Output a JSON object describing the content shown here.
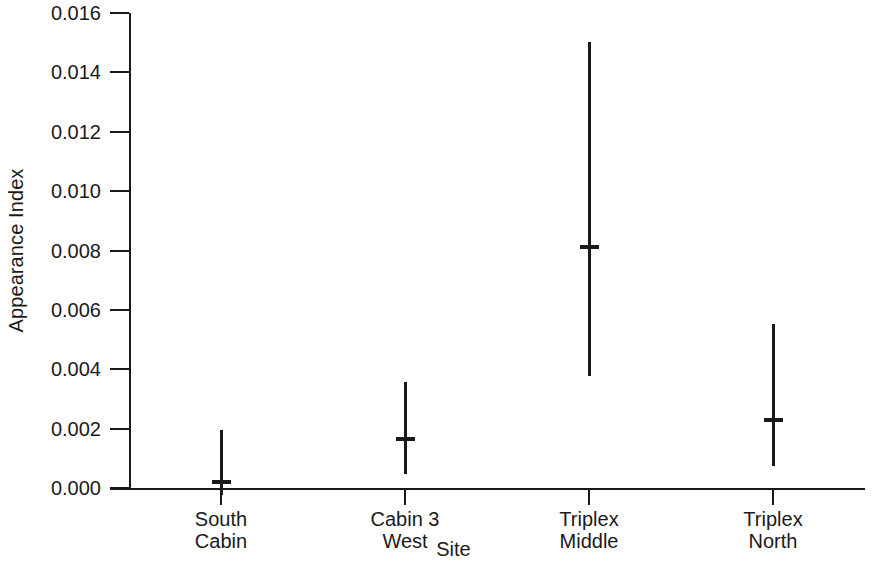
{
  "chart_data": {
    "type": "scatter",
    "title": "",
    "xlabel": "Site",
    "ylabel": "Appearance Index",
    "categories": [
      "South\nCabin",
      "Cabin 3\nWest",
      "Triplex\nMiddle",
      "Triplex\nNorth"
    ],
    "category_lines": [
      [
        "South",
        "Cabin"
      ],
      [
        "Cabin 3",
        "West"
      ],
      [
        "Triplex",
        "Middle"
      ],
      [
        "Triplex",
        "North"
      ]
    ],
    "values": [
      0.0002,
      0.00165,
      0.00812,
      0.00229
    ],
    "error_low": [
      -0.00024,
      0.00047,
      0.00377,
      0.00074
    ],
    "error_high": [
      0.00195,
      0.00357,
      0.01502,
      0.00552
    ],
    "ylim": [
      0.0,
      0.016
    ],
    "yticks": [
      0.0,
      0.002,
      0.004,
      0.006,
      0.008,
      0.01,
      0.012,
      0.014,
      0.016
    ],
    "ytick_labels": [
      "0.000",
      "0.002",
      "0.004",
      "0.006",
      "0.008",
      "0.010",
      "0.012",
      "0.014",
      "0.016"
    ],
    "grid": false,
    "legend": false,
    "series": [
      {
        "name": "Appearance Index",
        "values": [
          0.0002,
          0.00165,
          0.00812,
          0.00229
        ],
        "error_low": [
          -0.00024,
          0.00047,
          0.00377,
          0.00074
        ],
        "error_high": [
          0.00195,
          0.00357,
          0.01502,
          0.00552
        ]
      }
    ],
    "colors": {
      "axis": "#1a1a1a",
      "marker": "#1a1a1a",
      "errorbar": "#1a1a1a",
      "background": "#ffffff"
    }
  }
}
